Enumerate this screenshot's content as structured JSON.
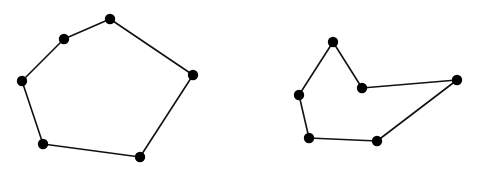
{
  "diagram": {
    "background": "#ffffff",
    "stroke_color": "#111111",
    "vertex_color": "#000000",
    "line_width": 1.6,
    "vertex_radius": 5.2,
    "polygons": [
      {
        "name": "convex-hexagon",
        "convex": true,
        "vertices": [
          [
            110,
            19
          ],
          [
            193,
            75
          ],
          [
            140,
            157
          ],
          [
            43,
            144
          ],
          [
            22,
            81
          ],
          [
            64,
            39
          ]
        ]
      },
      {
        "name": "concave-hexagon",
        "convex": false,
        "vertices": [
          [
            333,
            42
          ],
          [
            362,
            88
          ],
          [
            457,
            80
          ],
          [
            377,
            141
          ],
          [
            309,
            138
          ],
          [
            299,
            95
          ]
        ]
      }
    ]
  }
}
